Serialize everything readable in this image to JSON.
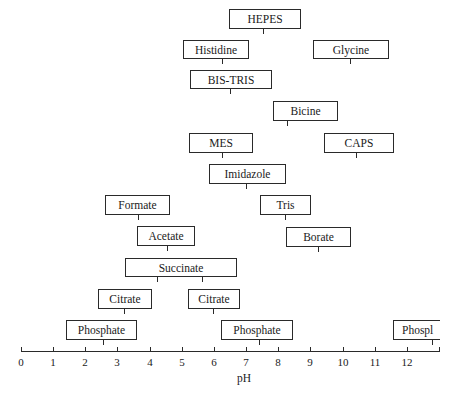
{
  "chart_data": {
    "type": "range-diagram",
    "title": "",
    "xlabel": "pH",
    "xlim": [
      0,
      13
    ],
    "x_ticks": [
      "0",
      "1",
      "2",
      "3",
      "4",
      "5",
      "6",
      "7",
      "8",
      "9",
      "10",
      "11",
      "12"
    ],
    "buffers": [
      {
        "name": "HEPES",
        "pH_low": 6.8,
        "pH_high": 9.0,
        "pKa": [
          7.5
        ]
      },
      {
        "name": "Histidine",
        "pH_low": 5.0,
        "pH_high": 7.1,
        "pKa": [
          6.0
        ]
      },
      {
        "name": "Glycine",
        "pH_low": 9.1,
        "pH_high": 11.5,
        "pKa": [
          9.6
        ]
      },
      {
        "name": "BIS-TRIS",
        "pH_low": 5.3,
        "pH_high": 7.8,
        "pKa": [
          6.5
        ]
      },
      {
        "name": "Bicine",
        "pH_low": 7.8,
        "pH_high": 9.9,
        "pKa": [
          8.3
        ]
      },
      {
        "name": "MES",
        "pH_low": 5.2,
        "pH_high": 7.2,
        "pKa": [
          6.1
        ]
      },
      {
        "name": "CAPS",
        "pH_low": 9.4,
        "pH_high": 11.6,
        "pKa": [
          10.4
        ]
      },
      {
        "name": "Imidazole",
        "pH_low": 5.9,
        "pH_high": 8.3,
        "pKa": [
          7.0
        ]
      },
      {
        "name": "Formate",
        "pH_low": 2.6,
        "pH_high": 4.6,
        "pKa": [
          3.75
        ]
      },
      {
        "name": "Tris",
        "pH_low": 7.4,
        "pH_high": 9.0,
        "pKa": [
          8.1
        ]
      },
      {
        "name": "Acetate",
        "pH_low": 3.6,
        "pH_high": 5.4,
        "pKa": [
          4.76
        ]
      },
      {
        "name": "Borate",
        "pH_low": 8.25,
        "pH_high": 10.3,
        "pKa": [
          9.2
        ]
      },
      {
        "name": "Succinate",
        "pH_low": 3.2,
        "pH_high": 6.7,
        "pKa": [
          4.2,
          5.6
        ]
      },
      {
        "name": "Citrate",
        "pH_low": 2.4,
        "pH_high": 4.1,
        "pKa": [
          3.1
        ]
      },
      {
        "name": "Citrate",
        "pH_low": 5.2,
        "pH_high": 6.8,
        "pKa": [
          4.8
        ]
      },
      {
        "name": "Phosphate",
        "pH_low": 1.4,
        "pH_high": 3.6,
        "pKa": [
          2.15
        ]
      },
      {
        "name": "Phosphate",
        "pH_low": 6.2,
        "pH_high": 8.5,
        "pKa": [
          7.2
        ]
      },
      {
        "name": "Phosphate",
        "pH_low": 11.6,
        "pH_high": 13.0,
        "pKa": [
          12.3
        ],
        "label_visible": "Phospl"
      }
    ],
    "grid": false,
    "legend": null
  },
  "boxes": [
    {
      "label": "HEPES",
      "x": 229,
      "y": 9,
      "w": 72,
      "h": 20,
      "ticks": [
        263
      ]
    },
    {
      "label": "Histidine",
      "x": 183,
      "y": 40,
      "w": 66,
      "h": 19,
      "ticks": [
        222
      ]
    },
    {
      "label": "Glycine",
      "x": 313,
      "y": 40,
      "w": 76,
      "h": 19,
      "ticks": [
        350
      ]
    },
    {
      "label": "BIS-TRIS",
      "x": 190,
      "y": 70,
      "w": 82,
      "h": 19,
      "ticks": [
        230
      ]
    },
    {
      "label": "Bicine",
      "x": 273,
      "y": 101,
      "w": 65,
      "h": 20,
      "ticks": [
        287
      ]
    },
    {
      "label": "MES",
      "x": 189,
      "y": 133,
      "w": 64,
      "h": 20,
      "ticks": [
        222
      ]
    },
    {
      "label": "CAPS",
      "x": 324,
      "y": 133,
      "w": 70,
      "h": 20,
      "ticks": [
        356
      ]
    },
    {
      "label": "Imidazole",
      "x": 209,
      "y": 164,
      "w": 77,
      "h": 20,
      "ticks": [
        246
      ]
    },
    {
      "label": "Formate",
      "x": 105,
      "y": 195,
      "w": 65,
      "h": 20,
      "ticks": [
        138
      ]
    },
    {
      "label": "Tris",
      "x": 260,
      "y": 195,
      "w": 51,
      "h": 20,
      "ticks": [
        285
      ]
    },
    {
      "label": "Acetate",
      "x": 137,
      "y": 226,
      "w": 58,
      "h": 20,
      "ticks": [
        167
      ]
    },
    {
      "label": "Borate",
      "x": 286,
      "y": 227,
      "w": 65,
      "h": 20,
      "ticks": [
        318
      ]
    },
    {
      "label": "Succinate",
      "x": 125,
      "y": 258,
      "w": 112,
      "h": 19,
      "ticks": [
        157,
        202
      ]
    },
    {
      "label": "Citrate",
      "x": 98,
      "y": 289,
      "w": 54,
      "h": 20,
      "ticks": [
        124
      ]
    },
    {
      "label": "Citrate",
      "x": 188,
      "y": 289,
      "w": 52,
      "h": 20,
      "ticks": [
        213
      ]
    },
    {
      "label": "Phosphate",
      "x": 66,
      "y": 320,
      "w": 71,
      "h": 20,
      "ticks": [
        103
      ]
    },
    {
      "label": "Phosphate",
      "x": 221,
      "y": 320,
      "w": 72,
      "h": 20,
      "ticks": [
        259
      ]
    },
    {
      "label": "Phospl",
      "x": 393,
      "y": 320,
      "w": 47,
      "h": 20,
      "ticks": [
        432
      ],
      "clipped": true
    }
  ],
  "axis": {
    "title": "pH",
    "x0": 21,
    "x_end": 439,
    "y": 351,
    "px_per_unit": 32.15,
    "labels": [
      "0",
      "1",
      "2",
      "3",
      "4",
      "5",
      "6",
      "7",
      "8",
      "9",
      "10",
      "11",
      "12"
    ],
    "extra_tick_at": 13
  }
}
